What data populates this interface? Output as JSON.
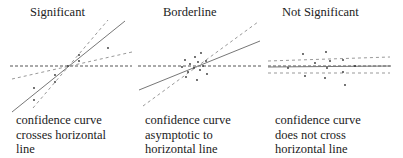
{
  "panels": [
    {
      "title": "Significant",
      "caption": [
        "confidence curve",
        "crosses horizontal",
        "line"
      ]
    },
    {
      "title": "Borderline",
      "caption": [
        "confidence curve",
        "asymptotic to",
        "horizontal line"
      ]
    },
    {
      "title": "Not Significant",
      "caption": [
        "confidence curve",
        "does not cross",
        "horizontal line"
      ]
    }
  ]
}
